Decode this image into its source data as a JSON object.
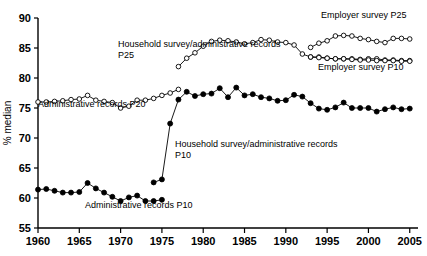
{
  "chart_data": {
    "type": "line",
    "title": "",
    "subtitle": "",
    "xlabel": "",
    "ylabel": "% median",
    "xlim": [
      1960,
      2006
    ],
    "ylim": [
      55,
      90
    ],
    "grid": false,
    "legend_position": "inline-annotations",
    "x_ticks": [
      1960,
      1965,
      1970,
      1975,
      1980,
      1985,
      1990,
      1995,
      2000,
      2005
    ],
    "y_ticks": [
      55,
      60,
      65,
      70,
      75,
      80,
      85,
      90
    ],
    "marker_colors": {
      "open": "#ffffff",
      "filled": "#000000",
      "stroke": "#000000"
    },
    "series": [
      {
        "name": "Administrative records P20",
        "marker": "open-circle",
        "x": [
          1960,
          1961,
          1962,
          1963,
          1964,
          1965,
          1966,
          1967,
          1968,
          1969,
          1970,
          1971,
          1972,
          1973,
          1974,
          1975,
          1976,
          1977
        ],
        "values": [
          76.0,
          76.0,
          76.1,
          76.2,
          76.4,
          76.5,
          77.1,
          76.3,
          76.1,
          75.9,
          75.0,
          75.3,
          76.3,
          76.3,
          76.6,
          77.1,
          77.5,
          78.1
        ]
      },
      {
        "name": "Household survey/administrative records P25",
        "marker": "open-circle",
        "x": [
          1977,
          1978,
          1979,
          1980,
          1981,
          1982,
          1983,
          1984,
          1985,
          1986,
          1987,
          1988,
          1989,
          1990,
          1991,
          1992,
          1993,
          1994,
          1995,
          1996,
          1997,
          1998,
          1999,
          2000,
          2001,
          2002,
          2003,
          2004,
          2005
        ],
        "values": [
          81.9,
          83.3,
          84.2,
          85.3,
          86.1,
          86.3,
          86.2,
          86.0,
          85.7,
          85.9,
          86.4,
          86.3,
          86.0,
          85.9,
          85.5,
          84.0,
          83.5,
          83.5,
          83.3,
          83.2,
          83.2,
          83.2,
          83.1,
          83.2,
          83.2,
          83.0,
          83.0,
          82.9,
          82.9
        ]
      },
      {
        "name": "Employer survey P25",
        "marker": "open-circle",
        "x": [
          1993,
          1994,
          1995,
          1996,
          1997,
          1998,
          1999,
          2000,
          2001,
          2002,
          2003,
          2004,
          2005
        ],
        "values": [
          85.1,
          85.8,
          86.2,
          87.0,
          87.1,
          87.0,
          86.6,
          86.4,
          86.1,
          85.9,
          86.6,
          86.6,
          86.5
        ]
      },
      {
        "name": "Employer survey P10",
        "marker": "open-circle",
        "x": [
          1993,
          1994,
          1995,
          1996,
          1997,
          1998,
          1999,
          2000,
          2001,
          2002,
          2003,
          2004,
          2005
        ],
        "values": [
          83.5,
          83.4,
          83.3,
          83.2,
          83.2,
          83.1,
          83.0,
          83.0,
          82.9,
          82.9,
          82.9,
          82.8,
          82.8
        ]
      },
      {
        "name": "Administrative records P10",
        "marker": "filled-circle",
        "x": [
          1960,
          1961,
          1962,
          1963,
          1964,
          1965,
          1966,
          1967,
          1968,
          1969,
          1970,
          1971,
          1972,
          1973,
          1974,
          1975
        ],
        "values": [
          61.4,
          61.5,
          61.2,
          60.9,
          60.9,
          61.0,
          62.5,
          61.6,
          60.9,
          60.2,
          59.5,
          60.1,
          60.4,
          59.5,
          59.5,
          59.7
        ]
      },
      {
        "name": "Household survey/administrative records P10",
        "marker": "filled-circle",
        "x": [
          1974,
          1975,
          1976,
          1977,
          1978,
          1979,
          1980,
          1981,
          1982,
          1983,
          1984,
          1985,
          1986,
          1987,
          1988,
          1989,
          1990,
          1991,
          1992,
          1993,
          1994,
          1995,
          1996,
          1997,
          1998,
          1999,
          2000,
          2001,
          2002,
          2003,
          2004,
          2005
        ],
        "values": [
          62.6,
          63.1,
          72.4,
          76.4,
          77.7,
          77.0,
          77.3,
          77.4,
          78.3,
          76.8,
          78.4,
          77.1,
          77.3,
          76.8,
          76.6,
          76.2,
          76.3,
          77.2,
          76.9,
          75.8,
          74.9,
          74.7,
          75.1,
          75.9,
          75.0,
          75.0,
          75.0,
          74.4,
          74.8,
          75.1,
          74.8,
          74.9
        ]
      }
    ],
    "annotations": [
      {
        "id": "admin-p20",
        "text": "Administrative records P20",
        "x_px": 38,
        "y_px": 107
      },
      {
        "id": "household-p25",
        "text": "Household survey/administrative records",
        "x_px": 118,
        "y_px": 47
      },
      {
        "id": "household-p25-b",
        "text": "P25",
        "x_px": 118,
        "y_px": 58
      },
      {
        "id": "employer-p25",
        "text": "Employer survey P25",
        "x_px": 321,
        "y_px": 18
      },
      {
        "id": "employer-p10",
        "text": "Employer survey P10",
        "x_px": 318,
        "y_px": 70
      },
      {
        "id": "household-p10",
        "text": "Household survey/administrative records",
        "x_px": 175,
        "y_px": 147
      },
      {
        "id": "household-p10-b",
        "text": "P10",
        "x_px": 175,
        "y_px": 158
      },
      {
        "id": "admin-p10",
        "text": "Administrative records P10",
        "x_px": 85,
        "y_px": 208
      }
    ]
  }
}
